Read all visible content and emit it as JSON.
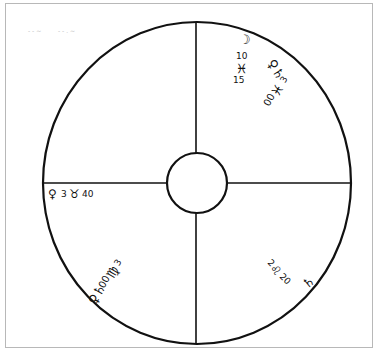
{
  "diagram": {
    "type": "astrological-chart",
    "colors": {
      "line": "#111111",
      "frame": "#b8b8b8",
      "background": "#ffffff"
    },
    "quadrants": {
      "upper_right": {
        "moon_group": {
          "symbol": "☽",
          "degree": "10",
          "sign": "♓",
          "minute": "15"
        },
        "planet_group": {
          "symbols": "♀♄",
          "degree": "3",
          "sign": "♓",
          "minute": "00"
        }
      },
      "left": {
        "symbol": "♀",
        "degree": "3",
        "sign": "♉",
        "minute": "40"
      },
      "lower_left": {
        "planet_group": {
          "symbols": "♀♄",
          "degree": "3",
          "sign": "♍",
          "minute": "00"
        }
      },
      "lower_right": {
        "planet_group": {
          "symbol": "♄",
          "degree": "2",
          "sign": "♌",
          "minute": "20"
        }
      }
    },
    "noise_marks": [
      "- - ~",
      "- - . ~"
    ]
  }
}
